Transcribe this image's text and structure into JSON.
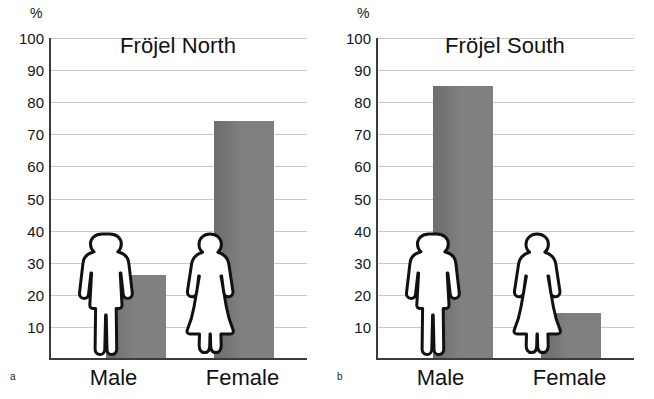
{
  "figure": {
    "axis_unit_label": "%",
    "y_ticks": [
      100,
      90,
      80,
      70,
      60,
      50,
      40,
      30,
      20,
      10
    ],
    "bar_color": "#808080",
    "grid_color": "#c9c9c9",
    "axis_color": "#3b3b3b",
    "panels": [
      {
        "letter": "a",
        "title": "Fröjel North",
        "categories": [
          "Male",
          "Female"
        ],
        "values": [
          26,
          74
        ],
        "icons": [
          "male-figure-icon",
          "female-figure-icon"
        ]
      },
      {
        "letter": "b",
        "title": "Fröjel South",
        "categories": [
          "Male",
          "Female"
        ],
        "values": [
          85,
          14
        ],
        "icons": [
          "male-figure-icon",
          "female-figure-icon"
        ]
      }
    ]
  },
  "chart_data": [
    {
      "type": "bar",
      "title": "Fröjel North",
      "panel_label": "a",
      "categories": [
        "Male",
        "Female"
      ],
      "values": [
        26,
        74
      ],
      "xlabel": "",
      "ylabel": "%",
      "ylim": [
        0,
        100
      ],
      "yticks": [
        10,
        20,
        30,
        40,
        50,
        60,
        70,
        80,
        90,
        100
      ],
      "grid": true,
      "legend": "none"
    },
    {
      "type": "bar",
      "title": "Fröjel South",
      "panel_label": "b",
      "categories": [
        "Male",
        "Female"
      ],
      "values": [
        85,
        14
      ],
      "xlabel": "",
      "ylabel": "%",
      "ylim": [
        0,
        100
      ],
      "yticks": [
        10,
        20,
        30,
        40,
        50,
        60,
        70,
        80,
        90,
        100
      ],
      "grid": true,
      "legend": "none"
    }
  ]
}
